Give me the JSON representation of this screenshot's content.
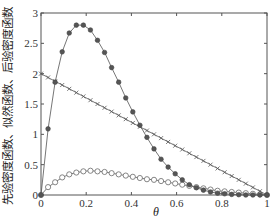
{
  "chart_data": {
    "type": "line",
    "title": "",
    "xlabel": "θ",
    "ylabel": "先验密度函数、似然函数、后验密度函数",
    "xlim": [
      0,
      1
    ],
    "ylim": [
      0,
      3
    ],
    "grid": false,
    "legend": null,
    "x_ticks": [
      "0",
      "0.2",
      "0.4",
      "0.6",
      "0.8",
      "1"
    ],
    "y_ticks": [
      "0",
      "0.5",
      "1",
      "1.5",
      "2",
      "2.5",
      "3"
    ],
    "x": [
      0,
      0.03125,
      0.0625,
      0.09375,
      0.125,
      0.15625,
      0.1875,
      0.21875,
      0.25,
      0.28125,
      0.3125,
      0.34375,
      0.375,
      0.40625,
      0.4375,
      0.46875,
      0.5,
      0.53125,
      0.5625,
      0.59375,
      0.625,
      0.65625,
      0.6875,
      0.71875,
      0.75,
      0.78125,
      0.8125,
      0.84375,
      0.875,
      0.90625,
      0.9375,
      0.96875,
      1
    ],
    "series": [
      {
        "name": "先验密度函数",
        "marker": "circle",
        "values": [
          0,
          0.13,
          0.21,
          0.29,
          0.34,
          0.37,
          0.39,
          0.4,
          0.39,
          0.38,
          0.36,
          0.34,
          0.32,
          0.3,
          0.28,
          0.26,
          0.25,
          0.23,
          0.21,
          0.19,
          0.17,
          0.15,
          0.13,
          0.11,
          0.09,
          0.07,
          0.06,
          0.05,
          0.04,
          0.03,
          0.02,
          0.01,
          0
        ]
      },
      {
        "name": "似然函数",
        "marker": "plus",
        "values": [
          2,
          1.9375,
          1.875,
          1.8125,
          1.75,
          1.6875,
          1.625,
          1.5625,
          1.5,
          1.4375,
          1.375,
          1.3125,
          1.25,
          1.1875,
          1.125,
          1.0625,
          1.0,
          0.9375,
          0.875,
          0.8125,
          0.75,
          0.6875,
          0.625,
          0.5625,
          0.5,
          0.4375,
          0.375,
          0.3125,
          0.25,
          0.1875,
          0.125,
          0.0625,
          0
        ]
      },
      {
        "name": "后验密度函数",
        "marker": "filled-circle",
        "values": [
          0,
          1.09,
          1.86,
          2.36,
          2.67,
          2.8,
          2.8,
          2.72,
          2.55,
          2.35,
          2.1,
          1.86,
          1.6,
          1.37,
          1.15,
          0.95,
          0.76,
          0.59,
          0.46,
          0.35,
          0.25,
          0.17,
          0.12,
          0.08,
          0.05,
          0.03,
          0.02,
          0.01,
          0.005,
          0,
          0,
          0,
          0
        ]
      }
    ]
  }
}
